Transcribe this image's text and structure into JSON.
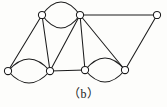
{
  "figure": {
    "caption": "（b）",
    "caption_plain": "(b)",
    "background_color": "#fdfdfb",
    "stroke_color": "#1c1c1c",
    "vertex_fill_color": "#ffffff",
    "width": 167,
    "height": 107
  },
  "chart_data": {
    "type": "diagram",
    "diagram_kind": "undirected-multigraph",
    "xlabel": "",
    "ylabel": "",
    "vertex_count": 7,
    "edge_count": 14,
    "vertex_radius": 3.6,
    "nodes": [
      {
        "id": "v1",
        "label": "",
        "x": 42,
        "y": 15,
        "degree": 4
      },
      {
        "id": "v2",
        "label": "",
        "x": 80,
        "y": 15,
        "degree": 6
      },
      {
        "id": "v3",
        "label": "",
        "x": 157,
        "y": 15,
        "degree": 2
      },
      {
        "id": "v4",
        "label": "",
        "x": 8,
        "y": 71,
        "degree": 3
      },
      {
        "id": "v5",
        "label": "",
        "x": 50,
        "y": 71,
        "degree": 5
      },
      {
        "id": "v6",
        "label": "",
        "x": 85,
        "y": 70,
        "degree": 5
      },
      {
        "id": "v7",
        "label": "",
        "x": 125,
        "y": 70,
        "degree": 4
      }
    ],
    "edges": [
      {
        "id": "e1",
        "source": "v1",
        "target": "v2",
        "style": "arc-up",
        "bow": -13
      },
      {
        "id": "e2",
        "source": "v1",
        "target": "v2",
        "style": "arc-down",
        "bow": 13
      },
      {
        "id": "e3",
        "source": "v4",
        "target": "v5",
        "style": "arc-up",
        "bow": -12
      },
      {
        "id": "e4",
        "source": "v4",
        "target": "v5",
        "style": "arc-down",
        "bow": 12
      },
      {
        "id": "e5",
        "source": "v6",
        "target": "v7",
        "style": "arc-up",
        "bow": -12
      },
      {
        "id": "e6",
        "source": "v6",
        "target": "v7",
        "style": "arc-down",
        "bow": 12
      },
      {
        "id": "e7",
        "source": "v1",
        "target": "v4",
        "style": "straight",
        "bow": 0
      },
      {
        "id": "e8",
        "source": "v1",
        "target": "v5",
        "style": "straight",
        "bow": 0
      },
      {
        "id": "e9",
        "source": "v2",
        "target": "v5",
        "style": "straight",
        "bow": 0
      },
      {
        "id": "e10",
        "source": "v2",
        "target": "v6",
        "style": "straight",
        "bow": 0
      },
      {
        "id": "e11",
        "source": "v2",
        "target": "v7",
        "style": "straight",
        "bow": 0
      },
      {
        "id": "e12",
        "source": "v2",
        "target": "v3",
        "style": "straight",
        "bow": 0
      },
      {
        "id": "e13",
        "source": "v3",
        "target": "v7",
        "style": "straight",
        "bow": 0
      },
      {
        "id": "e14",
        "source": "v5",
        "target": "v6",
        "style": "straight",
        "bow": 0
      }
    ]
  }
}
